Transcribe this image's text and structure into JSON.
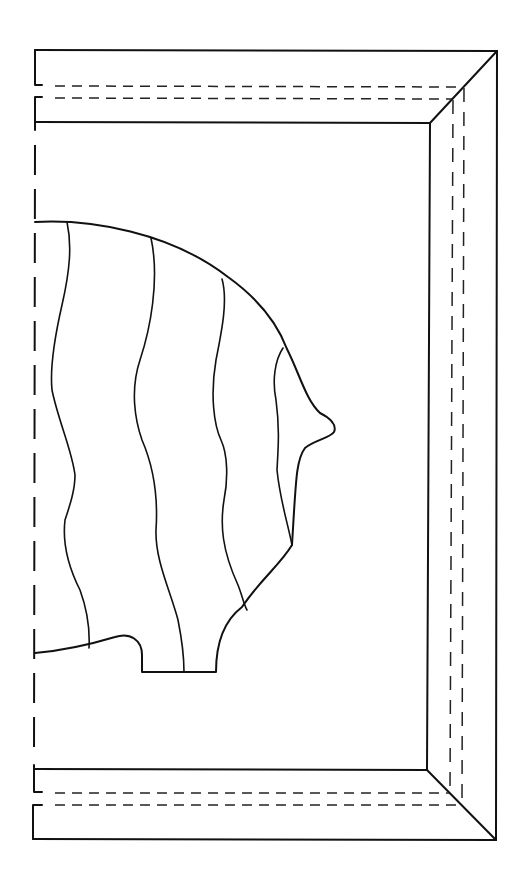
{
  "diagram": {
    "type": "line-drawing",
    "colors": {
      "line": "#111111",
      "background": "#ffffff"
    },
    "parts": [
      {
        "name": "outer-frame",
        "style": "solid"
      },
      {
        "name": "inner-frame",
        "style": "solid"
      },
      {
        "name": "mitre-corners",
        "count": 2
      },
      {
        "name": "rabbet-lines",
        "style": "dashed"
      },
      {
        "name": "fold-line-left",
        "style": "dashed"
      },
      {
        "name": "fish-body",
        "stripes": 4
      }
    ]
  }
}
